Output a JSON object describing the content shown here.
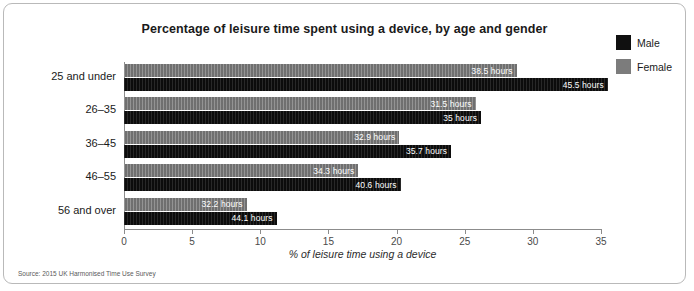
{
  "chart_data": {
    "type": "bar",
    "orientation": "horizontal",
    "title": "Percentage of leisure time spent using a device, by age and gender",
    "xlabel": "% of leisure time using a device",
    "ylabel": "",
    "xlim": [
      0,
      35
    ],
    "xticks": [
      0,
      5,
      10,
      15,
      20,
      25,
      30,
      35
    ],
    "xtick_labels": [
      "0",
      "5",
      "10",
      "15",
      "20",
      "25",
      "30",
      "35"
    ],
    "grid": false,
    "legend_position": "top-right",
    "categories": [
      "25 and under",
      "26–35",
      "36–45",
      "46–55",
      "56 and over"
    ],
    "series": [
      {
        "name": "Male",
        "color": "#101010",
        "values": [
          35.5,
          26.2,
          24.0,
          20.3,
          11.2
        ],
        "data_labels": [
          "45.5 hours",
          "35 hours",
          "35.7 hours",
          "40.6 hours",
          "44.1 hours"
        ]
      },
      {
        "name": "Female",
        "color": "#7c7c7c",
        "values": [
          28.8,
          25.8,
          20.2,
          17.2,
          9.0
        ],
        "data_labels": [
          "38.5 hours",
          "31.5 hours",
          "32.9 hours",
          "34.3 hours",
          "32.2 hours"
        ]
      }
    ],
    "source_note": "Source: 2015 UK Harmonised Time Use Survey"
  },
  "legend": {
    "items": [
      {
        "label": "Male",
        "color": "#101010"
      },
      {
        "label": "Female",
        "color": "#7c7c7c"
      }
    ]
  }
}
